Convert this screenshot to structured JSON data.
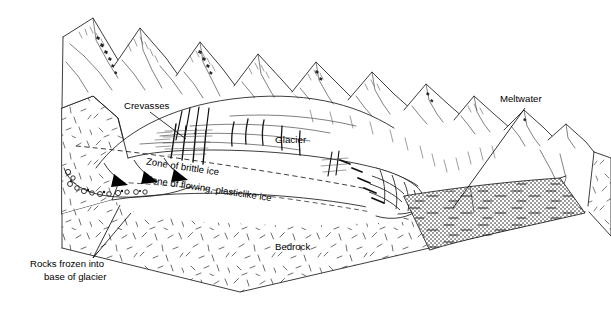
{
  "figure": {
    "type": "geological-block-diagram",
    "background_color": "#ffffff",
    "ink_color": "#1a1a1a",
    "water_fill_color": "#b4b4b4"
  },
  "labels": {
    "crevasses": "Crevasses",
    "glacier": "Glacier",
    "zone_brittle": "Zone of brittle ice",
    "zone_plastic": "Zone of flowing, plasticlike ice",
    "bedrock": "Bedrock",
    "meltwater": "Meltwater",
    "rocks_line1": "Rocks frozen into",
    "rocks_line2": "base of glacier"
  },
  "features": [
    {
      "name": "mountain-range",
      "description": "Jagged snow-capped peaks along the back of the block, largest at left decreasing to the right"
    },
    {
      "name": "glacier-body",
      "description": "Valley glacier flowing from upper left down to the right terminus"
    },
    {
      "name": "crevasse-field",
      "description": "Vertical cracks in the upper brittle surface of the glacier"
    },
    {
      "name": "brittle-plastic-boundary",
      "description": "Dashed line separating the zone of brittle ice above from plasticlike flowing ice below"
    },
    {
      "name": "flow-arrows",
      "description": "Three curved arrows showing ice flow direction at the glacier base"
    },
    {
      "name": "basal-rocks",
      "description": "Small circles of rock debris frozen into the base of the glacier"
    },
    {
      "name": "glacier-terminus",
      "description": "Crevassed snout of the glacier meeting the meltwater lake"
    },
    {
      "name": "meltwater-lake",
      "description": "Gray shaded water body at the glacier terminus"
    },
    {
      "name": "bedrock-mass",
      "description": "Stippled bedrock forming the cut faces of the block"
    }
  ]
}
